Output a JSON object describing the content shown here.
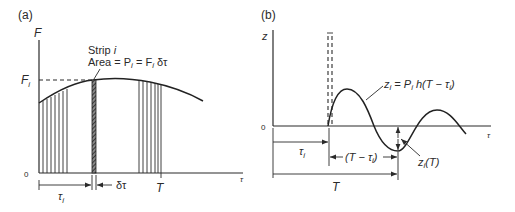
{
  "panel_a": {
    "label": "(a)",
    "y_axis_label": "F",
    "x_axis_label": "τ",
    "origin_label": "0",
    "fi_label": "F",
    "fi_sub": "i",
    "strip_title": "Strip i",
    "strip_area": "Area = P",
    "strip_area_mid": " = F",
    "strip_area_end": " δτ",
    "tau_i_label": "τ",
    "tau_i_sub": "i",
    "delta_tau_label": "δτ",
    "T_label": "T"
  },
  "panel_b": {
    "label": "(b)",
    "y_axis_label": "z",
    "x_axis_label": "τ",
    "origin_label": "0",
    "response_eq_a": "z",
    "response_eq_b": " = P",
    "response_eq_c": " h(T − τ",
    "response_eq_d": ")",
    "zi_T_a": "z",
    "zi_T_b": "(T)",
    "tau_i_label": "τ",
    "T_minus_tau_a": "(T − τ",
    "T_minus_tau_b": ")",
    "T_label": "T",
    "sub_i": "i"
  },
  "colors": {
    "ink": "#2a2a2a",
    "background": "#ffffff"
  }
}
